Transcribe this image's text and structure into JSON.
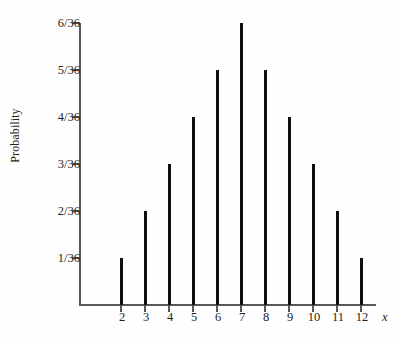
{
  "chart_data": {
    "type": "bar",
    "title": "",
    "subtitle": "",
    "xlabel": "x",
    "ylabel": "Probability",
    "categories": [
      2,
      3,
      4,
      5,
      6,
      7,
      8,
      9,
      10,
      11,
      12
    ],
    "category_labels": [
      "2",
      "3",
      "4",
      "5",
      "6",
      "7",
      "8",
      "9",
      "10",
      "11",
      "12"
    ],
    "values": [
      1,
      2,
      3,
      4,
      5,
      6,
      5,
      4,
      3,
      2,
      1
    ],
    "value_labels": [
      "1/36",
      "2/36",
      "3/36",
      "4/36",
      "5/36",
      "6/36",
      "5/36",
      "4/36",
      "3/36",
      "2/36",
      "1/36"
    ],
    "ylim": [
      0,
      6
    ],
    "ytick_values": [
      1,
      2,
      3,
      4,
      5,
      6
    ],
    "ytick_labels": [
      "1/36",
      "2/36",
      "3/36",
      "4/36",
      "5/36",
      "6/36"
    ],
    "xlim": [
      1.4,
      13.2
    ],
    "grid": false,
    "legend": null,
    "bar_color": "#0f0f10",
    "axis_color": "#58595b",
    "text_color": "#231f20",
    "background_color": "#fefefe",
    "annotations": []
  },
  "axis_titles": {
    "y": "Probability",
    "x": "x"
  }
}
